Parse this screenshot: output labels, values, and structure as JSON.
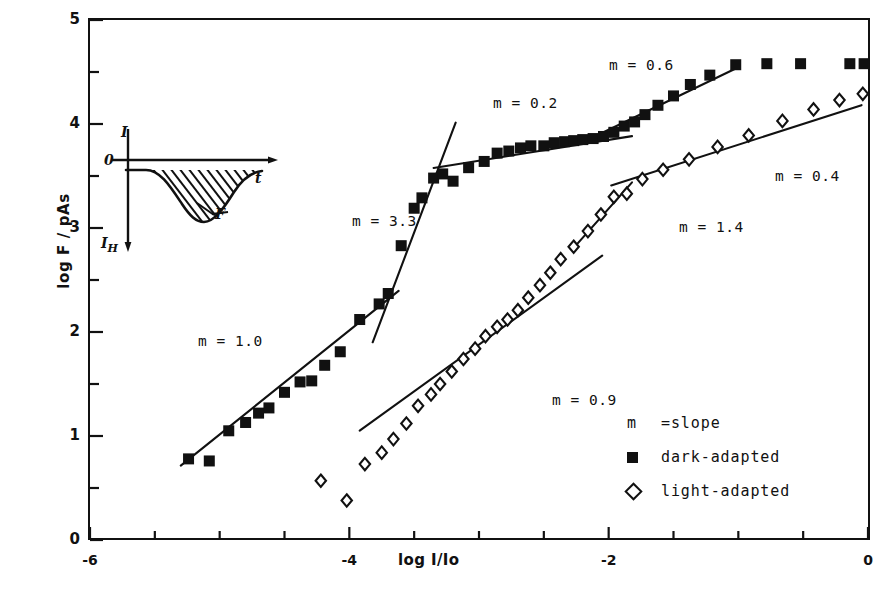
{
  "axes": {
    "ylabel": "log F / pAs",
    "xlabel": "log I/Io",
    "ytick_labels": [
      "0",
      "1",
      "2",
      "3",
      "4",
      "5"
    ],
    "xtick_labels": [
      "-6",
      "-4",
      "-2",
      "0"
    ],
    "xlim": [
      -6,
      0
    ],
    "ylim": [
      0,
      5
    ]
  },
  "legend": {
    "slope_key": "m",
    "slope_def": "=slope",
    "dark_label": "dark-adapted",
    "light_label": "light-adapted"
  },
  "inset": {
    "y_axis": "I",
    "origin": "0",
    "x_axis": "t",
    "bottom": "I",
    "bottom_sub": "H",
    "area": "F"
  },
  "annotations": [
    {
      "id": "m10",
      "text": "m = 1.0",
      "x": 198,
      "y": 333
    },
    {
      "id": "m33",
      "text": "m = 3.3",
      "x": 352,
      "y": 213
    },
    {
      "id": "m02",
      "text": "m = 0.2",
      "x": 493,
      "y": 95
    },
    {
      "id": "m06",
      "text": "m = 0.6",
      "x": 609,
      "y": 57
    },
    {
      "id": "m09",
      "text": "m = 0.9",
      "x": 552,
      "y": 392
    },
    {
      "id": "m14",
      "text": "m = 1.4",
      "x": 679,
      "y": 219
    },
    {
      "id": "m04",
      "text": "m = 0.4",
      "x": 775,
      "y": 168
    }
  ],
  "colors": {
    "ink": "#111111",
    "background": "#ffffff"
  },
  "chart_data": {
    "type": "scatter",
    "title": "",
    "xlabel": "log I/Io",
    "ylabel": "log F / pAs",
    "xlim": [
      -6,
      0
    ],
    "ylim": [
      0,
      5
    ],
    "xticks": [
      -6,
      -4,
      -2,
      0
    ],
    "yticks": [
      0,
      1,
      2,
      3,
      4,
      5
    ],
    "minor_tick_step": 0.5,
    "grid": false,
    "legend_position": "lower-right",
    "series": [
      {
        "name": "dark-adapted",
        "marker": "filled-square",
        "points": [
          [
            -5.24,
            0.78
          ],
          [
            -5.08,
            0.76
          ],
          [
            -4.93,
            1.05
          ],
          [
            -4.8,
            1.13
          ],
          [
            -4.7,
            1.22
          ],
          [
            -4.62,
            1.27
          ],
          [
            -4.5,
            1.42
          ],
          [
            -4.38,
            1.52
          ],
          [
            -4.29,
            1.53
          ],
          [
            -4.19,
            1.68
          ],
          [
            -4.07,
            1.81
          ],
          [
            -3.92,
            2.12
          ],
          [
            -3.77,
            2.27
          ],
          [
            -3.7,
            2.37
          ],
          [
            -3.6,
            2.83
          ],
          [
            -3.5,
            3.19
          ],
          [
            -3.44,
            3.29
          ],
          [
            -3.35,
            3.48
          ],
          [
            -3.28,
            3.52
          ],
          [
            -3.2,
            3.45
          ],
          [
            -3.08,
            3.58
          ],
          [
            -2.96,
            3.64
          ],
          [
            -2.86,
            3.72
          ],
          [
            -2.77,
            3.74
          ],
          [
            -2.68,
            3.77
          ],
          [
            -2.6,
            3.79
          ],
          [
            -2.5,
            3.79
          ],
          [
            -2.42,
            3.82
          ],
          [
            -2.34,
            3.83
          ],
          [
            -2.27,
            3.84
          ],
          [
            -2.2,
            3.85
          ],
          [
            -2.12,
            3.86
          ],
          [
            -2.04,
            3.88
          ],
          [
            -1.96,
            3.92
          ],
          [
            -1.88,
            3.98
          ],
          [
            -1.8,
            4.02
          ],
          [
            -1.72,
            4.09
          ],
          [
            -1.62,
            4.18
          ],
          [
            -1.5,
            4.27
          ],
          [
            -1.37,
            4.38
          ],
          [
            -1.22,
            4.47
          ],
          [
            -1.02,
            4.57
          ],
          [
            -0.78,
            4.58
          ],
          [
            -0.52,
            4.58
          ],
          [
            -0.14,
            4.58
          ],
          [
            -0.03,
            4.58
          ]
        ],
        "fit_segments": [
          {
            "slope": 1.0,
            "x_from": -5.3,
            "x_to": -3.62
          },
          {
            "slope": 3.3,
            "x_from": -3.82,
            "x_to": -3.18
          },
          {
            "slope": 0.2,
            "x_from": -3.35,
            "x_to": -1.82
          },
          {
            "slope": 0.6,
            "x_from": -2.1,
            "x_to": -1.0
          }
        ]
      },
      {
        "name": "light-adapted",
        "marker": "open-diamond",
        "points": [
          [
            -4.22,
            0.57
          ],
          [
            -4.02,
            0.38
          ],
          [
            -3.88,
            0.73
          ],
          [
            -3.75,
            0.84
          ],
          [
            -3.66,
            0.97
          ],
          [
            -3.56,
            1.12
          ],
          [
            -3.47,
            1.29
          ],
          [
            -3.37,
            1.4
          ],
          [
            -3.3,
            1.5
          ],
          [
            -3.21,
            1.62
          ],
          [
            -3.12,
            1.74
          ],
          [
            -3.03,
            1.84
          ],
          [
            -2.95,
            1.96
          ],
          [
            -2.86,
            2.05
          ],
          [
            -2.78,
            2.12
          ],
          [
            -2.7,
            2.21
          ],
          [
            -2.62,
            2.33
          ],
          [
            -2.53,
            2.45
          ],
          [
            -2.45,
            2.57
          ],
          [
            -2.37,
            2.7
          ],
          [
            -2.27,
            2.82
          ],
          [
            -2.16,
            2.97
          ],
          [
            -2.06,
            3.13
          ],
          [
            -1.96,
            3.3
          ],
          [
            -1.86,
            3.33
          ],
          [
            -1.74,
            3.47
          ],
          [
            -1.58,
            3.56
          ],
          [
            -1.38,
            3.66
          ],
          [
            -1.16,
            3.78
          ],
          [
            -0.92,
            3.89
          ],
          [
            -0.66,
            4.03
          ],
          [
            -0.42,
            4.14
          ],
          [
            -0.22,
            4.23
          ],
          [
            -0.04,
            4.29
          ]
        ],
        "fit_segments": [
          {
            "slope": 0.9,
            "x_from": -3.92,
            "x_to": -2.05
          },
          {
            "slope": 1.4,
            "x_from": -2.28,
            "x_to": -1.82
          },
          {
            "slope": 0.4,
            "x_from": -1.98,
            "x_to": -0.05
          }
        ]
      }
    ],
    "annotations": [
      {
        "text": "m = 1.0",
        "series": "dark-adapted"
      },
      {
        "text": "m = 3.3",
        "series": "dark-adapted"
      },
      {
        "text": "m = 0.2",
        "series": "dark-adapted"
      },
      {
        "text": "m = 0.6",
        "series": "dark-adapted"
      },
      {
        "text": "m = 0.9",
        "series": "light-adapted"
      },
      {
        "text": "m = 1.4",
        "series": "light-adapted"
      },
      {
        "text": "m = 0.4",
        "series": "light-adapted"
      }
    ],
    "inset": {
      "description": "photoreceptor current response waveform; hatched area under the curve labelled F",
      "y_axis": "I",
      "x_axis": "t",
      "origin": "0",
      "baseline_label": "I_H"
    }
  }
}
